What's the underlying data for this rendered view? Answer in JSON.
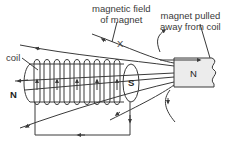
{
  "labels": {
    "field_line1": "magnetic field",
    "field_line2": "of magnet",
    "pulled_line1": "magnet pulled",
    "pulled_line2": "away from coil",
    "coil": "coil",
    "x_marker": "X",
    "coil_north": "N",
    "coil_south": "S",
    "magnet_north": "N"
  },
  "colors": {
    "line": "#3a3a3a",
    "magnet_fill": "#ececec",
    "text": "#3a3a3a"
  }
}
